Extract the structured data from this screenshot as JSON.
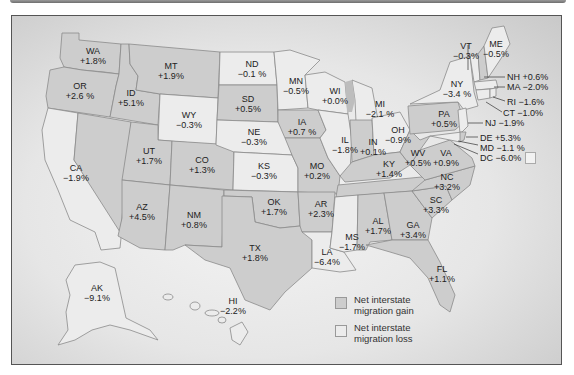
{
  "figure": {
    "type": "choropleth"
  },
  "legend": {
    "gain": {
      "label": "Net interstate migration gain",
      "color": "#cdcdcd"
    },
    "loss": {
      "label": "Net interstate migration loss",
      "color": "#ececec"
    }
  },
  "states": {
    "WA": {
      "abbr": "WA",
      "value": "+1.8%",
      "cat": "gain"
    },
    "OR": {
      "abbr": "OR",
      "value": "+2.6 %",
      "cat": "gain"
    },
    "CA": {
      "abbr": "CA",
      "value": "−1.9%",
      "cat": "loss"
    },
    "ID": {
      "abbr": "ID",
      "value": "+5.1%",
      "cat": "gain"
    },
    "MT": {
      "abbr": "MT",
      "value": "+1.9%",
      "cat": "gain"
    },
    "WY": {
      "abbr": "WY",
      "value": "−0.3%",
      "cat": "loss"
    },
    "UT": {
      "abbr": "UT",
      "value": "+1.7%",
      "cat": "gain"
    },
    "CO": {
      "abbr": "CO",
      "value": "+1.3%",
      "cat": "gain"
    },
    "AZ": {
      "abbr": "AZ",
      "value": "+4.5%",
      "cat": "gain"
    },
    "NM": {
      "abbr": "NM",
      "value": "+0.8%",
      "cat": "gain"
    },
    "ND": {
      "abbr": "ND",
      "value": "−0.1  %",
      "cat": "loss"
    },
    "SD": {
      "abbr": "SD",
      "value": "+0.5%",
      "cat": "gain"
    },
    "NE": {
      "abbr": "NE",
      "value": "−0.3%",
      "cat": "loss"
    },
    "KS": {
      "abbr": "KS",
      "value": "−0.3%",
      "cat": "loss"
    },
    "OK": {
      "abbr": "OK",
      "value": "+1.7%",
      "cat": "gain"
    },
    "TX": {
      "abbr": "TX",
      "value": "+1.8%",
      "cat": "gain"
    },
    "MN": {
      "abbr": "MN",
      "value": "−0.5%",
      "cat": "loss"
    },
    "IA": {
      "abbr": "IA",
      "value": "+0.7 %",
      "cat": "gain"
    },
    "MO": {
      "abbr": "MO",
      "value": "+0.2%",
      "cat": "gain"
    },
    "AR": {
      "abbr": "AR",
      "value": "+2.3%",
      "cat": "gain"
    },
    "LA": {
      "abbr": "LA",
      "value": "−6.4%",
      "cat": "loss"
    },
    "WI": {
      "abbr": "WI",
      "value": "+0.0%",
      "cat": "loss"
    },
    "IL": {
      "abbr": "IL",
      "value": "−1.8%",
      "cat": "loss"
    },
    "MI": {
      "abbr": "MI",
      "value": "−2.1 %",
      "cat": "loss"
    },
    "IN": {
      "abbr": "IN",
      "value": "+0.1%",
      "cat": "gain"
    },
    "OH": {
      "abbr": "OH",
      "value": "−0.9%",
      "cat": "loss"
    },
    "KY": {
      "abbr": "KY",
      "value": "+1.4%",
      "cat": "gain"
    },
    "TN": {
      "abbr": "TN",
      "value": "",
      "cat": "gain"
    },
    "MS": {
      "abbr": "MS",
      "value": "−1.7%",
      "cat": "loss"
    },
    "AL": {
      "abbr": "AL",
      "value": "+1.7%",
      "cat": "gain"
    },
    "GA": {
      "abbr": "GA",
      "value": "+3.4%",
      "cat": "gain"
    },
    "FL": {
      "abbr": "FL",
      "value": "+1.1%",
      "cat": "gain"
    },
    "SC": {
      "abbr": "SC",
      "value": "+3.3%",
      "cat": "gain"
    },
    "NC": {
      "abbr": "NC",
      "value": "+3.2%",
      "cat": "gain"
    },
    "VA": {
      "abbr": "VA",
      "value": "+0.9%",
      "cat": "gain"
    },
    "WV": {
      "abbr": "WV",
      "value": "+0.5%",
      "cat": "gain"
    },
    "PA": {
      "abbr": "PA",
      "value": "+0.5%",
      "cat": "gain"
    },
    "NY": {
      "abbr": "NY",
      "value": "−3.4 %",
      "cat": "loss"
    },
    "VT": {
      "abbr": "VT",
      "value": "−0.3%",
      "cat": "loss"
    },
    "ME": {
      "abbr": "ME",
      "value": "−0.5%",
      "cat": "loss"
    },
    "AK": {
      "abbr": "AK",
      "value": "−9.1%",
      "cat": "loss"
    },
    "HI": {
      "abbr": "HI",
      "value": "−2.2%",
      "cat": "loss"
    }
  },
  "callouts": {
    "NH": "NH +0.6%",
    "MA": "MA −2.0%",
    "RI": "RI −1.6%",
    "CT": "CT −1.0%",
    "NJ": "NJ −1.9%",
    "DE": "DE +5.3%",
    "MD": "MD −1.1 %",
    "DC": "DC −6.0%"
  }
}
